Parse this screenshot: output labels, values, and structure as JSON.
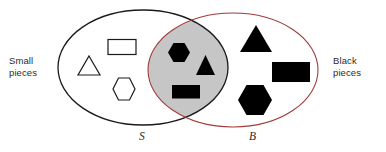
{
  "diagram": {
    "type": "venn",
    "title": "",
    "background_color": "#ffffff",
    "sets": {
      "left": {
        "letter": "S",
        "label": "Small\npieces",
        "stroke_color": "#1a1a1a",
        "label_side": "left"
      },
      "right": {
        "letter": "B",
        "label": "Black\npieces",
        "stroke_color": "#a23b3b",
        "label_side": "right"
      }
    },
    "intersection": {
      "fill_color": "#c6c6c6",
      "shape_fill": "#000000",
      "items": [
        {
          "shape": "hexagon",
          "fill": "black",
          "size": "small"
        },
        {
          "shape": "triangle",
          "fill": "black",
          "size": "small"
        },
        {
          "shape": "rectangle",
          "fill": "black",
          "size": "small"
        }
      ]
    },
    "left_only": {
      "shape_fill": "#ffffff",
      "shape_stroke": "#1a1a1a",
      "items": [
        {
          "shape": "triangle",
          "fill": "white",
          "size": "small"
        },
        {
          "shape": "rectangle",
          "fill": "white",
          "size": "small"
        },
        {
          "shape": "hexagon",
          "fill": "white",
          "size": "small"
        }
      ]
    },
    "right_only": {
      "shape_fill": "#000000",
      "items": [
        {
          "shape": "triangle",
          "fill": "black",
          "size": "large"
        },
        {
          "shape": "rectangle",
          "fill": "black",
          "size": "large"
        },
        {
          "shape": "hexagon",
          "fill": "black",
          "size": "large"
        }
      ]
    }
  }
}
